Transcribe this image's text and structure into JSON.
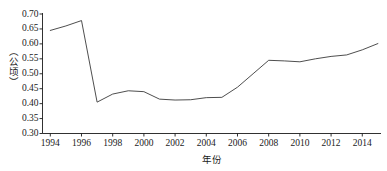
{
  "chart_data": {
    "type": "line",
    "title": "",
    "xlabel": "年份",
    "ylabel": "（公顷）",
    "xlim": [
      1993.5,
      2015.2
    ],
    "ylim": [
      0.3,
      0.7
    ],
    "grid": false,
    "legend": null,
    "line_color": "#3a3a3a",
    "axis_color": "#1a1a1a",
    "background": "#ffffff",
    "ytick_labels": [
      "0.70",
      "0.65",
      "0.60",
      "0.55",
      "0.50",
      "0.45",
      "0.40",
      "0.35",
      "0.30"
    ],
    "ytick_values": [
      0.7,
      0.65,
      0.6,
      0.55,
      0.5,
      0.45,
      0.4,
      0.35,
      0.3
    ],
    "xtick_labels": [
      "1994",
      "1996",
      "1998",
      "2000",
      "2002",
      "2004",
      "2006",
      "2008",
      "2010",
      "2012",
      "2014"
    ],
    "xtick_values": [
      1994,
      1996,
      1998,
      2000,
      2002,
      2004,
      2006,
      2008,
      2010,
      2012,
      2014
    ],
    "x": [
      1994,
      1995,
      1996,
      1997,
      1998,
      1999,
      2000,
      2001,
      2002,
      2003,
      2004,
      2005,
      2006,
      2007,
      2008,
      2009,
      2010,
      2011,
      2012,
      2013,
      2014,
      2015
    ],
    "values": [
      0.645,
      0.66,
      0.678,
      0.405,
      0.432,
      0.443,
      0.44,
      0.415,
      0.412,
      0.413,
      0.42,
      0.421,
      0.455,
      0.5,
      0.545,
      0.543,
      0.54,
      0.55,
      0.558,
      0.563,
      0.58,
      0.601
    ],
    "series": [
      {
        "name": "",
        "values": [
          0.645,
          0.66,
          0.678,
          0.405,
          0.432,
          0.443,
          0.44,
          0.415,
          0.412,
          0.413,
          0.42,
          0.421,
          0.455,
          0.5,
          0.545,
          0.543,
          0.54,
          0.55,
          0.558,
          0.563,
          0.58,
          0.601
        ]
      }
    ]
  }
}
